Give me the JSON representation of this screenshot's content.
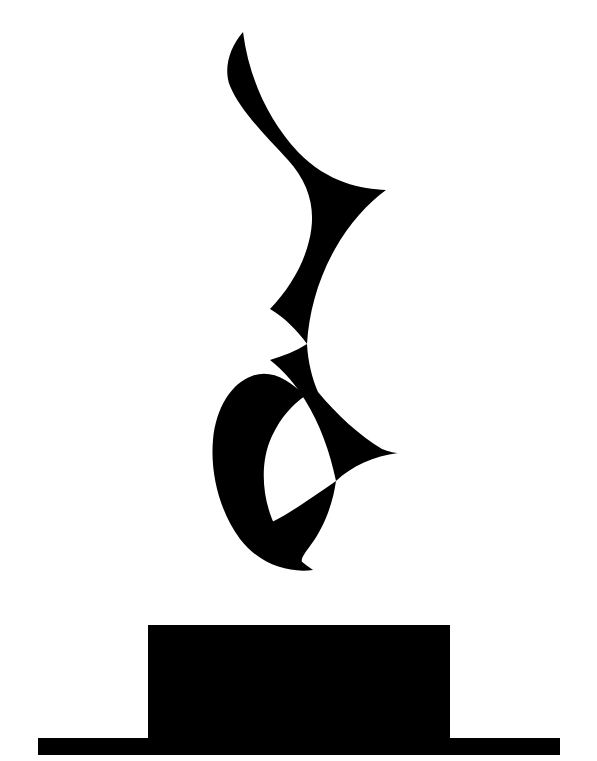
{
  "image": {
    "title": "Black Flourish Ornament On Pedestal",
    "description": "High-contrast black silhouette graphic on plain white background",
    "width": 597,
    "height": 761,
    "background_color": "#ffffff",
    "ink_color": "#000000"
  },
  "figure": {
    "name": "flourish-ornament",
    "label": "Flourish Ornament",
    "kind": "silhouette",
    "fill": "#000000",
    "bounds": {
      "x": 205,
      "y": 30,
      "width": 195,
      "height": 545
    },
    "path": "M 243 32 C 246 70 262 110 290 140 C 330 183 368 190 386 190 C 370 202 350 225 336 255 C 316 296 310 334 318 392 C 300 372 282 358 262 351 C 292 330 312 300 318 268 C 325 232 312 205 288 183 C 262 158 240 130 231 101 C 226 82 230 52 243 32 Z",
    "segments": [
      {
        "name": "upper-lobe",
        "tip": {
          "x": 243,
          "y": 32
        },
        "right_extreme": {
          "x": 386,
          "y": 190
        }
      },
      {
        "name": "middle-pinch",
        "left_extreme": {
          "x": 225,
          "y": 270
        }
      },
      {
        "name": "notch-wedge",
        "tip": {
          "x": 318,
          "y": 392
        }
      },
      {
        "name": "lower-lobe",
        "right_extreme": {
          "x": 398,
          "y": 453
        },
        "left_extreme": {
          "x": 213,
          "y": 452
        }
      },
      {
        "name": "bottom-tail",
        "tip": {
          "x": 313,
          "y": 570
        }
      }
    ]
  },
  "pedestal": {
    "name": "pedestal",
    "label": "Pedestal",
    "fill": "#000000",
    "column": {
      "name": "pedestal-column",
      "label": "Pedestal Column",
      "x": 148,
      "y": 625,
      "width": 302,
      "height": 113
    },
    "base": {
      "name": "pedestal-base",
      "label": "Pedestal Base Bar",
      "x": 38,
      "y": 738,
      "width": 522,
      "height": 17
    }
  }
}
